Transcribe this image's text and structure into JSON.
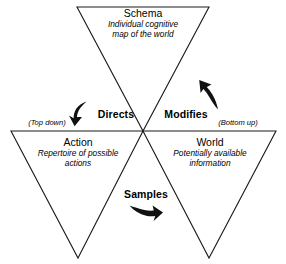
{
  "figure": {
    "type": "triangle-cycle-diagram",
    "background_color": "#ffffff",
    "line_color": "#1a1a1a",
    "text_color": "#000000"
  },
  "nodes": [
    {
      "id": "schema",
      "title": "Schema",
      "subtitle_line1": "Individual cognitive",
      "subtitle_line2": "map of the world",
      "position": "top"
    },
    {
      "id": "action",
      "title": "Action",
      "subtitle_line1": "Repertoire of possible",
      "subtitle_line2": "actions",
      "position": "bottom-left"
    },
    {
      "id": "world",
      "title": "World",
      "subtitle_line1": "Potentially available",
      "subtitle_line2": "information",
      "position": "bottom-right"
    }
  ],
  "relations": [
    {
      "id": "directs",
      "label": "Directs",
      "from": "schema",
      "to": "action",
      "arrow": "curved-arrow-down-left"
    },
    {
      "id": "samples",
      "label": "Samples",
      "from": "action",
      "to": "world",
      "arrow": "curved-arrow-right"
    },
    {
      "id": "modifies",
      "label": "Modifies",
      "from": "world",
      "to": "schema",
      "arrow": "curved-arrow-up"
    }
  ],
  "annotations": [
    {
      "id": "top-down",
      "label": "(Top down)"
    },
    {
      "id": "bottom-up",
      "label": "(Bottom up)"
    }
  ]
}
